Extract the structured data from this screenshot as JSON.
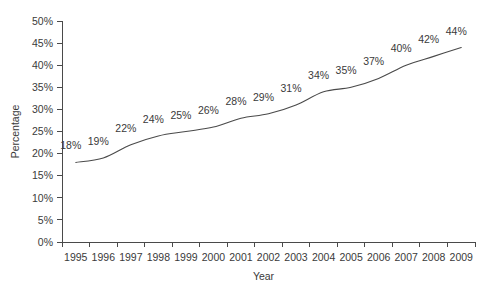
{
  "chart_data": {
    "type": "line",
    "title": "",
    "xlabel": "Year",
    "ylabel": "Percentage",
    "categories": [
      "1995",
      "1996",
      "1997",
      "1998",
      "1999",
      "2000",
      "2001",
      "2002",
      "2003",
      "2004",
      "2005",
      "2006",
      "2007",
      "2008",
      "2009"
    ],
    "values": [
      18,
      19,
      22,
      24,
      25,
      26,
      28,
      29,
      31,
      34,
      35,
      37,
      40,
      42,
      44
    ],
    "point_labels": [
      "18%",
      "19%",
      "22%",
      "24%",
      "25%",
      "26%",
      "28%",
      "29%",
      "31%",
      "34%",
      "35%",
      "37%",
      "40%",
      "42%",
      "44%"
    ],
    "ylim": [
      0,
      50
    ],
    "ytick_values": [
      0,
      5,
      10,
      15,
      20,
      25,
      30,
      35,
      40,
      45,
      50
    ],
    "ytick_labels": [
      "0%",
      "5%",
      "10%",
      "15%",
      "20%",
      "25%",
      "30%",
      "35%",
      "40%",
      "45%",
      "50%"
    ],
    "grid": false,
    "legend": null,
    "series_color": "#4a4a4a",
    "text_color": "#3a3a3a",
    "background": "#ffffff"
  }
}
